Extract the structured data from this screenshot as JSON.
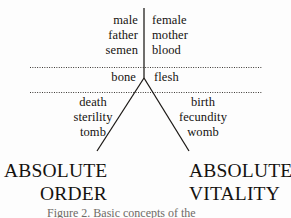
{
  "figure": {
    "background_color": "#fdfdfd",
    "ink_color": "#15120f"
  },
  "axes": {
    "vertical_divider": "vertical-dividing-line",
    "upper_boundary": "dotted-rule-upper",
    "lower_boundary": "dotted-rule-lower",
    "splay": "v-shaped-diverging-lines"
  },
  "quadrants": {
    "top_left": {
      "terms": [
        "male",
        "father",
        "semen"
      ]
    },
    "top_right": {
      "terms": [
        "female",
        "mother",
        "blood"
      ]
    },
    "middle_left": {
      "terms": [
        "bone"
      ]
    },
    "middle_right": {
      "terms": [
        "flesh"
      ]
    },
    "bottom_left": {
      "terms": [
        "death",
        "sterility",
        "tomb"
      ]
    },
    "bottom_right": {
      "terms": [
        "birth",
        "fecundity",
        "womb"
      ]
    }
  },
  "poles": {
    "left": {
      "line1": "ABSOLUTE",
      "line2": "ORDER"
    },
    "right": {
      "line1": "ABSOLUTE",
      "line2": "VITALITY"
    }
  },
  "caption": {
    "text": "Figure 2.  Basic concepts of the"
  }
}
